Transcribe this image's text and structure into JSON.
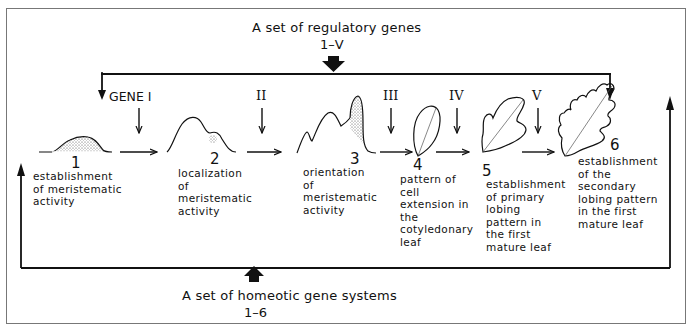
{
  "top_input": {
    "title": "A set of regulatory genes",
    "range": "1–V"
  },
  "bottom_input": {
    "title": "A set of homeotic gene systems",
    "range": "1–6"
  },
  "genes": [
    {
      "label": "GENE  I"
    },
    {
      "label": "II"
    },
    {
      "label": "III"
    },
    {
      "label": "IV"
    },
    {
      "label": "V"
    }
  ],
  "stages": [
    {
      "number": "1",
      "description": "establishment of meristematic activity"
    },
    {
      "number": "2",
      "description": "localization of meristematic activity"
    },
    {
      "number": "3",
      "description": "orientation of meristematic activity"
    },
    {
      "number": "4",
      "description": "pattern of cell extension in the cotyledonary leaf"
    },
    {
      "number": "5",
      "description": "establishment of primary lobing pattern in the first mature leaf"
    },
    {
      "number": "6",
      "description": "establishment of the secondary lobing pattern in the first mature leaf"
    }
  ]
}
